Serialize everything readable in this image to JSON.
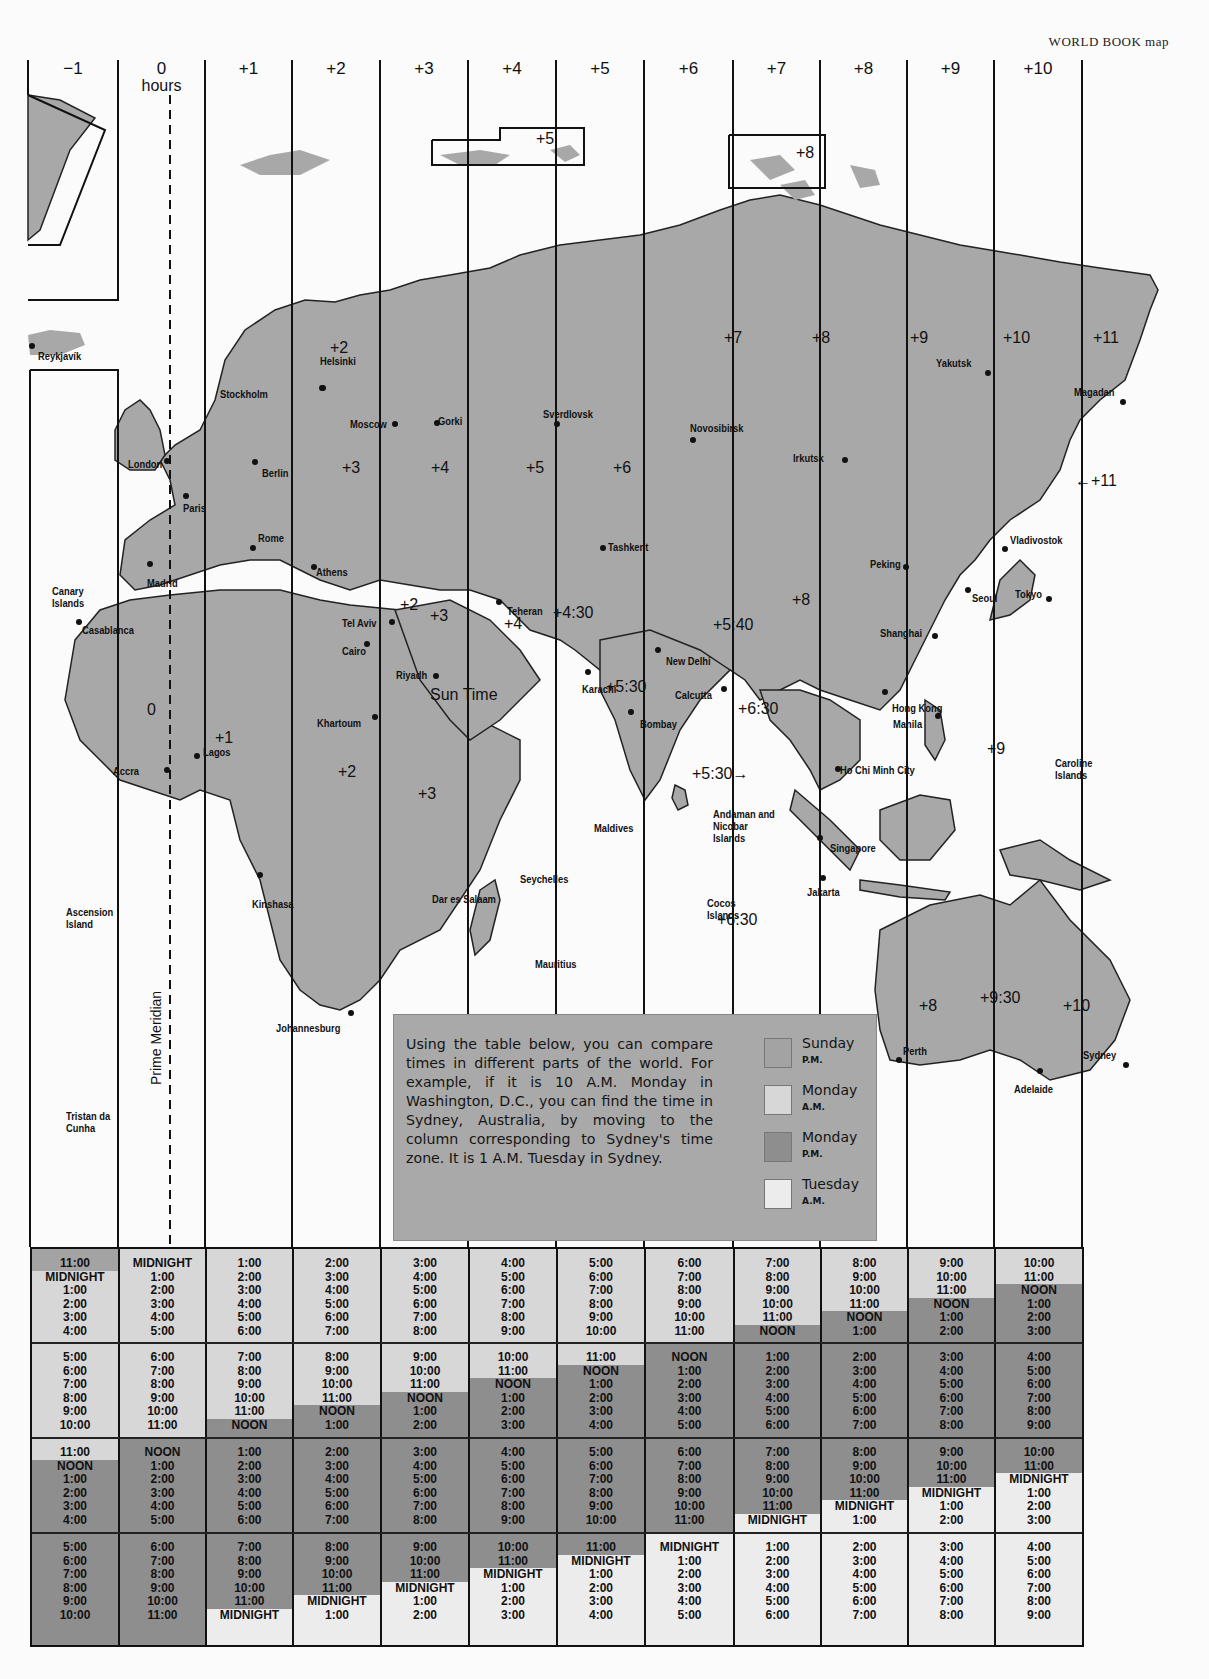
{
  "credit": "WORLD BOOK map",
  "zones": [
    {
      "label": "−1",
      "sub": ""
    },
    {
      "label": "0",
      "sub": "hours"
    },
    {
      "label": "+1",
      "sub": ""
    },
    {
      "label": "+2",
      "sub": ""
    },
    {
      "label": "+3",
      "sub": ""
    },
    {
      "label": "+4",
      "sub": ""
    },
    {
      "label": "+5",
      "sub": ""
    },
    {
      "label": "+6",
      "sub": ""
    },
    {
      "label": "+7",
      "sub": ""
    },
    {
      "label": "+8",
      "sub": ""
    },
    {
      "label": "+9",
      "sub": ""
    },
    {
      "label": "+10",
      "sub": ""
    }
  ],
  "map": {
    "prime_meridian_label": "Prime Meridian",
    "colors": {
      "land": "#a8a8a8",
      "water": "#ffffff",
      "border": "#111111"
    },
    "cities": [
      {
        "name": "Reykjavík"
      },
      {
        "name": "Stockholm"
      },
      {
        "name": "Helsinki"
      },
      {
        "name": "London"
      },
      {
        "name": "Berlin"
      },
      {
        "name": "Paris"
      },
      {
        "name": "Moscow"
      },
      {
        "name": "Gorki"
      },
      {
        "name": "Sverdlovsk"
      },
      {
        "name": "Novosibirsk"
      },
      {
        "name": "Irkutsk"
      },
      {
        "name": "Yakutsk"
      },
      {
        "name": "Magadan"
      },
      {
        "name": "Rome"
      },
      {
        "name": "Madrid"
      },
      {
        "name": "Athens"
      },
      {
        "name": "Tashkent"
      },
      {
        "name": "Vladivostok"
      },
      {
        "name": "Peking"
      },
      {
        "name": "Seoul"
      },
      {
        "name": "Tokyo"
      },
      {
        "name": "Casablanca"
      },
      {
        "name": "Tel Aviv"
      },
      {
        "name": "Teheran"
      },
      {
        "name": "Cairo"
      },
      {
        "name": "Riyadh"
      },
      {
        "name": "New Delhi"
      },
      {
        "name": "Karachi"
      },
      {
        "name": "Calcutta"
      },
      {
        "name": "Shanghai"
      },
      {
        "name": "Bombay"
      },
      {
        "name": "Hong Kong"
      },
      {
        "name": "Manila"
      },
      {
        "name": "Ho Chi Minh City"
      },
      {
        "name": "Khartoum"
      },
      {
        "name": "Accra"
      },
      {
        "name": "Lagos"
      },
      {
        "name": "Singapore"
      },
      {
        "name": "Kinshasa"
      },
      {
        "name": "Dar es Salaam"
      },
      {
        "name": "Jakarta"
      },
      {
        "name": "Johannesburg"
      },
      {
        "name": "Perth"
      },
      {
        "name": "Sydney"
      },
      {
        "name": "Adelaide"
      }
    ],
    "places": [
      "Canary Islands",
      "Ascension Island",
      "Tristan da Cunha",
      "Maldives",
      "Seychelles",
      "Mauritius",
      "Andaman and Nicobar Islands",
      "Cocos Islands",
      "Caroline Islands"
    ],
    "zone_labels": [
      "+5",
      "+8",
      "+2",
      "+3",
      "+4",
      "+5",
      "+6",
      "+7",
      "+8",
      "+9",
      "+10",
      "+11",
      "←+11",
      "0",
      "+1",
      "+2",
      "+3",
      "+2",
      "+3",
      "+4",
      "+4:30",
      "+5:40",
      "+8",
      "+5:30",
      "+6:30",
      "+5:30→",
      "+9",
      "+6:30",
      "+8",
      "+9:30",
      "+10",
      "Sun Time"
    ]
  },
  "info": {
    "text": "Using the table below, you can compare times in different parts of the world. For example, if it is 10 A.M. Monday in Washington, D.C., you can find the time in Sydney, Australia, by moving to the column corresponding to Sydney's time zone. It is 1 A.M. Tuesday in Sydney.",
    "legend": [
      {
        "day": "Sunday",
        "ampm": "P.M.",
        "color": "#a3a3a3"
      },
      {
        "day": "Monday",
        "ampm": "A.M.",
        "color": "#d7d7d7"
      },
      {
        "day": "Monday",
        "ampm": "P.M.",
        "color": "#8e8e8e"
      },
      {
        "day": "Tuesday",
        "ampm": "A.M.",
        "color": "#ececec"
      }
    ]
  },
  "table": {
    "colors": {
      "sunday_pm": "#a3a3a3",
      "monday_am": "#d7d7d7",
      "monday_pm": "#8e8e8e",
      "tuesday_am": "#ececec"
    },
    "columns": [
      {
        "zone": "-1",
        "rows": [
          [
            "11:00",
            "MIDNIGHT",
            "1:00",
            "2:00",
            "3:00",
            "4:00"
          ],
          [
            "5:00",
            "6:00",
            "7:00",
            "8:00",
            "9:00",
            "10:00"
          ],
          [
            "11:00",
            "NOON",
            "1:00",
            "2:00",
            "3:00",
            "4:00"
          ],
          [
            "5:00",
            "6:00",
            "7:00",
            "8:00",
            "9:00",
            "10:00"
          ]
        ]
      },
      {
        "zone": "0",
        "rows": [
          [
            "MIDNIGHT",
            "1:00",
            "2:00",
            "3:00",
            "4:00",
            "5:00"
          ],
          [
            "6:00",
            "7:00",
            "8:00",
            "9:00",
            "10:00",
            "11:00"
          ],
          [
            "NOON",
            "1:00",
            "2:00",
            "3:00",
            "4:00",
            "5:00"
          ],
          [
            "6:00",
            "7:00",
            "8:00",
            "9:00",
            "10:00",
            "11:00"
          ]
        ]
      },
      {
        "zone": "+1",
        "rows": [
          [
            "1:00",
            "2:00",
            "3:00",
            "4:00",
            "5:00",
            "6:00"
          ],
          [
            "7:00",
            "8:00",
            "9:00",
            "10:00",
            "11:00",
            "NOON"
          ],
          [
            "1:00",
            "2:00",
            "3:00",
            "4:00",
            "5:00",
            "6:00"
          ],
          [
            "7:00",
            "8:00",
            "9:00",
            "10:00",
            "11:00",
            "MIDNIGHT"
          ]
        ]
      },
      {
        "zone": "+2",
        "rows": [
          [
            "2:00",
            "3:00",
            "4:00",
            "5:00",
            "6:00",
            "7:00"
          ],
          [
            "8:00",
            "9:00",
            "10:00",
            "11:00",
            "NOON",
            "1:00"
          ],
          [
            "2:00",
            "3:00",
            "4:00",
            "5:00",
            "6:00",
            "7:00"
          ],
          [
            "8:00",
            "9:00",
            "10:00",
            "11:00",
            "MIDNIGHT",
            "1:00"
          ]
        ]
      },
      {
        "zone": "+3",
        "rows": [
          [
            "3:00",
            "4:00",
            "5:00",
            "6:00",
            "7:00",
            "8:00"
          ],
          [
            "9:00",
            "10:00",
            "11:00",
            "NOON",
            "1:00",
            "2:00"
          ],
          [
            "3:00",
            "4:00",
            "5:00",
            "6:00",
            "7:00",
            "8:00"
          ],
          [
            "9:00",
            "10:00",
            "11:00",
            "MIDNIGHT",
            "1:00",
            "2:00"
          ]
        ]
      },
      {
        "zone": "+4",
        "rows": [
          [
            "4:00",
            "5:00",
            "6:00",
            "7:00",
            "8:00",
            "9:00"
          ],
          [
            "10:00",
            "11:00",
            "NOON",
            "1:00",
            "2:00",
            "3:00"
          ],
          [
            "4:00",
            "5:00",
            "6:00",
            "7:00",
            "8:00",
            "9:00"
          ],
          [
            "10:00",
            "11:00",
            "MIDNIGHT",
            "1:00",
            "2:00",
            "3:00"
          ]
        ]
      },
      {
        "zone": "+5",
        "rows": [
          [
            "5:00",
            "6:00",
            "7:00",
            "8:00",
            "9:00",
            "10:00"
          ],
          [
            "11:00",
            "NOON",
            "1:00",
            "2:00",
            "3:00",
            "4:00"
          ],
          [
            "5:00",
            "6:00",
            "7:00",
            "8:00",
            "9:00",
            "10:00"
          ],
          [
            "11:00",
            "MIDNIGHT",
            "1:00",
            "2:00",
            "3:00",
            "4:00"
          ]
        ]
      },
      {
        "zone": "+6",
        "rows": [
          [
            "6:00",
            "7:00",
            "8:00",
            "9:00",
            "10:00",
            "11:00"
          ],
          [
            "NOON",
            "1:00",
            "2:00",
            "3:00",
            "4:00",
            "5:00"
          ],
          [
            "6:00",
            "7:00",
            "8:00",
            "9:00",
            "10:00",
            "11:00"
          ],
          [
            "MIDNIGHT",
            "1:00",
            "2:00",
            "3:00",
            "4:00",
            "5:00"
          ]
        ]
      },
      {
        "zone": "+7",
        "rows": [
          [
            "7:00",
            "8:00",
            "9:00",
            "10:00",
            "11:00",
            "NOON"
          ],
          [
            "1:00",
            "2:00",
            "3:00",
            "4:00",
            "5:00",
            "6:00"
          ],
          [
            "7:00",
            "8:00",
            "9:00",
            "10:00",
            "11:00",
            "MIDNIGHT"
          ],
          [
            "1:00",
            "2:00",
            "3:00",
            "4:00",
            "5:00",
            "6:00"
          ]
        ]
      },
      {
        "zone": "+8",
        "rows": [
          [
            "8:00",
            "9:00",
            "10:00",
            "11:00",
            "NOON",
            "1:00"
          ],
          [
            "2:00",
            "3:00",
            "4:00",
            "5:00",
            "6:00",
            "7:00"
          ],
          [
            "8:00",
            "9:00",
            "10:00",
            "11:00",
            "MIDNIGHT",
            "1:00"
          ],
          [
            "2:00",
            "3:00",
            "4:00",
            "5:00",
            "6:00",
            "7:00"
          ]
        ]
      },
      {
        "zone": "+9",
        "rows": [
          [
            "9:00",
            "10:00",
            "11:00",
            "NOON",
            "1:00",
            "2:00"
          ],
          [
            "3:00",
            "4:00",
            "5:00",
            "6:00",
            "7:00",
            "8:00"
          ],
          [
            "9:00",
            "10:00",
            "11:00",
            "MIDNIGHT",
            "1:00",
            "2:00"
          ],
          [
            "3:00",
            "4:00",
            "5:00",
            "6:00",
            "7:00",
            "8:00"
          ]
        ]
      },
      {
        "zone": "+10",
        "rows": [
          [
            "10:00",
            "11:00",
            "NOON",
            "1:00",
            "2:00",
            "3:00"
          ],
          [
            "4:00",
            "5:00",
            "6:00",
            "7:00",
            "8:00",
            "9:00"
          ],
          [
            "10:00",
            "11:00",
            "MIDNIGHT",
            "1:00",
            "2:00",
            "3:00"
          ],
          [
            "4:00",
            "5:00",
            "6:00",
            "7:00",
            "8:00",
            "9:00"
          ]
        ]
      }
    ]
  }
}
